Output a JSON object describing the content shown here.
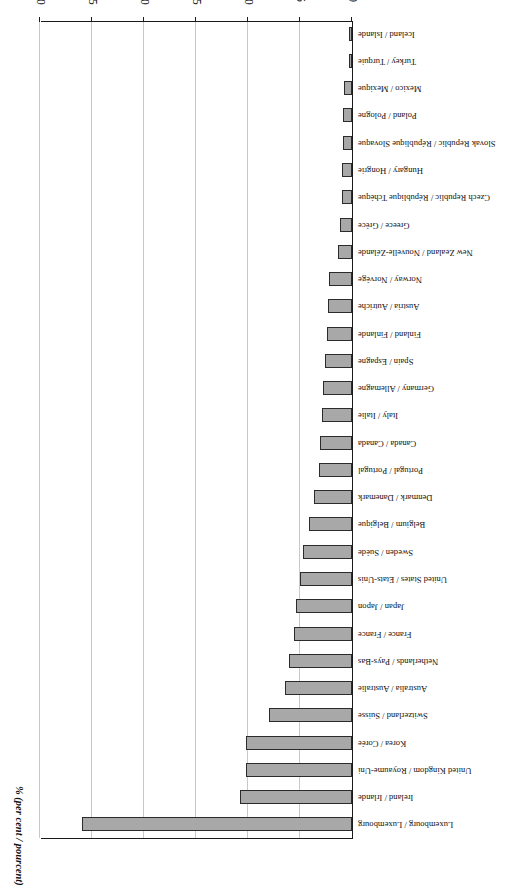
{
  "figure": {
    "rotation_degrees": 180,
    "axis_title": "% (per cent / pourcent)",
    "frame_color": "#1a1a1a",
    "bar_fill_color": "#a8a8a8",
    "bar_border_color": "#2b2b2b",
    "gridline_color": "#c9c9c9",
    "background_color": "#ffffff"
  },
  "chart_data": {
    "type": "bar",
    "orientation": "horizontal",
    "title": "",
    "subtitle": "",
    "xlabel": "% (per cent / pourcent)",
    "ylabel": "",
    "xlim": [
      0,
      30
    ],
    "xticks": [
      0,
      5,
      10,
      15,
      20,
      25,
      30
    ],
    "xtick_labels": [
      "0",
      "5",
      "10",
      "15",
      "20",
      "25",
      "30"
    ],
    "grid": true,
    "grid_axis": "x",
    "legend": false,
    "legend_position": "none",
    "categories": [
      "Luxembourg / Luxembourg",
      "Ireland / Irlande",
      "United Kingdom / Royaume-Uni",
      "Korea / Corée",
      "Switzerland / Suisse",
      "Australia / Australie",
      "Netherlands / Pays-Bas",
      "France / France",
      "Japan / Japon",
      "United States / Etats-Unis",
      "Sweden / Suède",
      "Belgium / Belgique",
      "Denmark / Danemark",
      "Portugal / Portugal",
      "Canada / Canada",
      "Italy / Italie",
      "Germany / Allemagne",
      "Spain / Espagne",
      "Finland / Finlande",
      "Austria / Autriche",
      "Norway / Norvège",
      "New Zealand / Nouvelle-Zélande",
      "Greece / Grèce",
      "Czech Republic / République Tchèque",
      "Hungary / Hongrie",
      "Slovak Republic / République Slovaque",
      "Poland / Pologne",
      "Mexico / Mexique",
      "Turkey / Turquie",
      "Iceland / Islande"
    ],
    "values": [
      26.0,
      10.8,
      10.2,
      10.2,
      8.0,
      6.4,
      6.1,
      5.6,
      5.4,
      5.0,
      4.7,
      4.1,
      3.7,
      3.2,
      3.1,
      2.9,
      2.8,
      2.6,
      2.4,
      2.3,
      2.2,
      1.3,
      1.2,
      1.0,
      1.0,
      0.9,
      0.9,
      0.8,
      0.3,
      0.3
    ]
  }
}
